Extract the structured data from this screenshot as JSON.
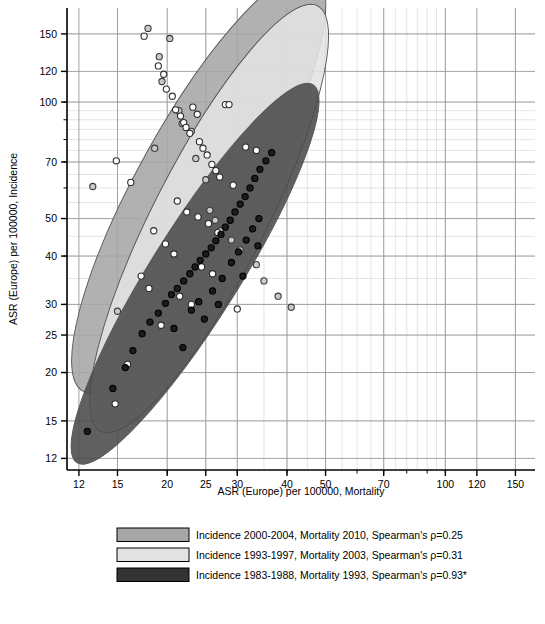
{
  "chart_data": {
    "type": "scatter",
    "title": "",
    "xlabel": "ASR (Europe) per 100000, Mortality",
    "ylabel": "ASR (Europe) per 100000, Incidence",
    "xscale": "log",
    "yscale": "log",
    "xlim": [
      11.2,
      168
    ],
    "ylim": [
      11.2,
      175
    ],
    "grid": true,
    "minor_grid": true,
    "xticks": [
      12,
      15,
      20,
      25,
      30,
      40,
      50,
      70,
      100,
      120,
      150
    ],
    "xticklabels": [
      "12",
      "15",
      "20",
      "25",
      "30",
      "40",
      "50",
      "70",
      "100",
      "120",
      "150"
    ],
    "yticks": [
      12,
      15,
      20,
      25,
      30,
      40,
      50,
      70,
      100,
      120,
      150
    ],
    "yticklabels": [
      "12",
      "15",
      "20",
      "25",
      "30",
      "40",
      "50",
      "70",
      "100",
      "120",
      "150"
    ],
    "legend_position": "below-axis-title",
    "series": [
      {
        "name": "Incidence 2000-2004, Mortality 2010, Spearman's ρ=0.25",
        "period_incidence": "2000-2004",
        "period_mortality": "2010",
        "spearman_rho": 0.25,
        "significant": false,
        "color": "#a6a6a6",
        "marker": "open-circle",
        "marker_fill": "#c9c9c9",
        "marker_edge": "#3b3b3b",
        "ellipse": {
          "cx": 24.0,
          "cy": 62.0,
          "rx_log": 0.6,
          "ry_log": 0.155,
          "angle_deg": -61
        },
        "points": [
          {
            "x": 13.0,
            "y": 60.5
          },
          {
            "x": 15.0,
            "y": 28.8
          },
          {
            "x": 17.9,
            "y": 155.0
          },
          {
            "x": 18.6,
            "y": 76.0
          },
          {
            "x": 19.1,
            "y": 131.0
          },
          {
            "x": 19.4,
            "y": 113.0
          },
          {
            "x": 20.3,
            "y": 146.0
          },
          {
            "x": 21.4,
            "y": 95.0
          },
          {
            "x": 21.8,
            "y": 88.0
          },
          {
            "x": 23.0,
            "y": 84.0
          },
          {
            "x": 23.6,
            "y": 71.5
          },
          {
            "x": 25.0,
            "y": 63.0
          },
          {
            "x": 25.6,
            "y": 52.5
          },
          {
            "x": 26.4,
            "y": 49.5
          },
          {
            "x": 27.2,
            "y": 46.5
          },
          {
            "x": 29.0,
            "y": 44.0
          },
          {
            "x": 30.5,
            "y": 41.5
          },
          {
            "x": 33.5,
            "y": 38.0
          },
          {
            "x": 35.0,
            "y": 34.5
          },
          {
            "x": 38.0,
            "y": 31.5
          },
          {
            "x": 41.0,
            "y": 29.5
          }
        ]
      },
      {
        "name": "Incidence 1993-1997, Mortality 2003, Spearman's ρ=0.31",
        "period_incidence": "1993-1997",
        "period_mortality": "2003",
        "spearman_rho": 0.31,
        "significant": false,
        "color": "#e3e3e3",
        "marker": "open-circle",
        "marker_fill": "#ffffff",
        "marker_edge": "#2e2e2e",
        "ellipse": {
          "cx": 25.5,
          "cy": 50.0,
          "rx_log": 0.6,
          "ry_log": 0.145,
          "angle_deg": -63
        },
        "points": [
          {
            "x": 14.9,
            "y": 70.5
          },
          {
            "x": 16.2,
            "y": 62.0
          },
          {
            "x": 17.5,
            "y": 148.0
          },
          {
            "x": 19.0,
            "y": 124.0
          },
          {
            "x": 19.6,
            "y": 118.0
          },
          {
            "x": 19.9,
            "y": 108.0
          },
          {
            "x": 20.6,
            "y": 103.5
          },
          {
            "x": 21.0,
            "y": 95.5
          },
          {
            "x": 21.6,
            "y": 92.0
          },
          {
            "x": 22.0,
            "y": 88.5
          },
          {
            "x": 22.3,
            "y": 86.0
          },
          {
            "x": 22.8,
            "y": 83.0
          },
          {
            "x": 23.2,
            "y": 97.0
          },
          {
            "x": 23.8,
            "y": 93.0
          },
          {
            "x": 24.1,
            "y": 79.0
          },
          {
            "x": 24.6,
            "y": 76.0
          },
          {
            "x": 25.2,
            "y": 73.0
          },
          {
            "x": 25.9,
            "y": 69.0
          },
          {
            "x": 26.5,
            "y": 66.5
          },
          {
            "x": 27.1,
            "y": 64.0
          },
          {
            "x": 28.0,
            "y": 98.5
          },
          {
            "x": 28.6,
            "y": 98.5
          },
          {
            "x": 29.3,
            "y": 61.0
          },
          {
            "x": 21.2,
            "y": 55.5
          },
          {
            "x": 22.4,
            "y": 52.0
          },
          {
            "x": 23.9,
            "y": 50.5
          },
          {
            "x": 25.4,
            "y": 48.5
          },
          {
            "x": 26.8,
            "y": 46.0
          },
          {
            "x": 18.5,
            "y": 46.5
          },
          {
            "x": 19.8,
            "y": 43.0
          },
          {
            "x": 20.8,
            "y": 40.5
          },
          {
            "x": 24.4,
            "y": 37.5
          },
          {
            "x": 26.0,
            "y": 36.0
          },
          {
            "x": 17.2,
            "y": 35.5
          },
          {
            "x": 18.0,
            "y": 33.0
          },
          {
            "x": 21.5,
            "y": 31.5
          },
          {
            "x": 23.0,
            "y": 30.0
          },
          {
            "x": 31.5,
            "y": 76.5
          },
          {
            "x": 33.5,
            "y": 75.0
          },
          {
            "x": 30.0,
            "y": 29.2
          },
          {
            "x": 19.3,
            "y": 26.5
          },
          {
            "x": 15.9,
            "y": 21.0
          },
          {
            "x": 14.8,
            "y": 16.6
          }
        ]
      },
      {
        "name": "Incidence 1983-1988, Mortality 1993, Spearman's ρ=0.93*",
        "period_incidence": "1983-1988",
        "period_mortality": "1993",
        "spearman_rho": 0.93,
        "significant": true,
        "color": "#4a4a4a",
        "marker": "filled-circle",
        "marker_fill": "#1c1c1c",
        "marker_edge": "#000000",
        "ellipse": {
          "cx": 23.5,
          "cy": 36.0,
          "rx_log": 0.56,
          "ry_log": 0.115,
          "angle_deg": -58
        },
        "points": [
          {
            "x": 12.6,
            "y": 14.1
          },
          {
            "x": 14.6,
            "y": 18.2
          },
          {
            "x": 15.7,
            "y": 20.6
          },
          {
            "x": 16.4,
            "y": 22.8
          },
          {
            "x": 17.3,
            "y": 25.2
          },
          {
            "x": 18.1,
            "y": 27.0
          },
          {
            "x": 19.0,
            "y": 28.5
          },
          {
            "x": 19.8,
            "y": 30.2
          },
          {
            "x": 20.5,
            "y": 31.8
          },
          {
            "x": 21.2,
            "y": 33.0
          },
          {
            "x": 22.0,
            "y": 34.5
          },
          {
            "x": 22.8,
            "y": 36.0
          },
          {
            "x": 23.5,
            "y": 37.5
          },
          {
            "x": 24.2,
            "y": 39.0
          },
          {
            "x": 25.0,
            "y": 40.5
          },
          {
            "x": 25.8,
            "y": 42.0
          },
          {
            "x": 26.5,
            "y": 43.8
          },
          {
            "x": 27.3,
            "y": 45.5
          },
          {
            "x": 28.0,
            "y": 47.5
          },
          {
            "x": 28.8,
            "y": 49.5
          },
          {
            "x": 29.6,
            "y": 52.0
          },
          {
            "x": 30.5,
            "y": 54.5
          },
          {
            "x": 31.4,
            "y": 57.0
          },
          {
            "x": 32.3,
            "y": 60.0
          },
          {
            "x": 33.2,
            "y": 63.5
          },
          {
            "x": 34.2,
            "y": 67.0
          },
          {
            "x": 35.4,
            "y": 70.5
          },
          {
            "x": 36.6,
            "y": 74.0
          },
          {
            "x": 20.8,
            "y": 26.0
          },
          {
            "x": 23.0,
            "y": 29.0
          },
          {
            "x": 24.0,
            "y": 30.5
          },
          {
            "x": 26.0,
            "y": 32.5
          },
          {
            "x": 27.5,
            "y": 35.0
          },
          {
            "x": 29.0,
            "y": 38.5
          },
          {
            "x": 30.2,
            "y": 41.0
          },
          {
            "x": 31.6,
            "y": 44.0
          },
          {
            "x": 32.8,
            "y": 47.0
          },
          {
            "x": 34.0,
            "y": 50.0
          },
          {
            "x": 21.9,
            "y": 23.2
          },
          {
            "x": 24.8,
            "y": 27.5
          },
          {
            "x": 26.9,
            "y": 30.0
          },
          {
            "x": 31.0,
            "y": 35.5
          },
          {
            "x": 33.8,
            "y": 42.5
          }
        ]
      }
    ]
  },
  "legend": {
    "items": [
      {
        "label": "Incidence 2000-2004, Mortality 2010, Spearman's ρ=0.25",
        "swatch": "#a6a6a6"
      },
      {
        "label": "Incidence 1993-1997, Mortality 2003, Spearman's ρ=0.31",
        "swatch": "#e3e3e3"
      },
      {
        "label": "Incidence 1983-1988, Mortality 1993, Spearman's ρ=0.93*",
        "swatch": "#333333"
      }
    ]
  }
}
